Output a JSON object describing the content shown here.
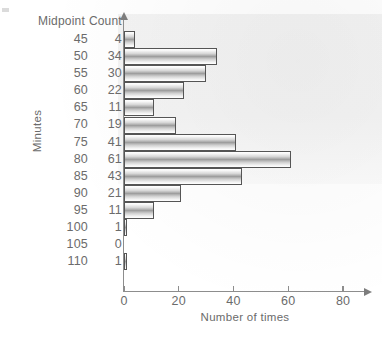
{
  "chart_data": {
    "type": "bar",
    "orientation": "horizontal",
    "title": "",
    "xlabel": "Number of times",
    "ylabel": "Minutes",
    "xlim": [
      0,
      88
    ],
    "xticks": [
      0,
      20,
      40,
      60,
      80
    ],
    "grid": false,
    "legend": null,
    "categories": [
      45,
      50,
      55,
      60,
      65,
      70,
      75,
      80,
      85,
      90,
      95,
      100,
      105,
      110
    ],
    "values": [
      4,
      34,
      30,
      22,
      11,
      19,
      41,
      61,
      43,
      21,
      11,
      1,
      0,
      1
    ]
  },
  "table": {
    "headers": {
      "midpoint": "Midpoint",
      "count": "Count"
    },
    "rows": [
      {
        "midpoint": "45",
        "count": "4"
      },
      {
        "midpoint": "50",
        "count": "34"
      },
      {
        "midpoint": "55",
        "count": "30"
      },
      {
        "midpoint": "60",
        "count": "22"
      },
      {
        "midpoint": "65",
        "count": "11"
      },
      {
        "midpoint": "70",
        "count": "19"
      },
      {
        "midpoint": "75",
        "count": "41"
      },
      {
        "midpoint": "80",
        "count": "61"
      },
      {
        "midpoint": "85",
        "count": "43"
      },
      {
        "midpoint": "90",
        "count": "21"
      },
      {
        "midpoint": "95",
        "count": "11"
      },
      {
        "midpoint": "100",
        "count": "1"
      },
      {
        "midpoint": "105",
        "count": "0"
      },
      {
        "midpoint": "110",
        "count": "1"
      }
    ]
  },
  "axes": {
    "y_title": "Minutes",
    "x_title": "Number of times",
    "x_tick_labels": [
      "0",
      "20",
      "40",
      "60",
      "80"
    ]
  },
  "colors": {
    "ink": "#6b6b6b",
    "axis": "#8d8d8d",
    "bar_outline": "#555555",
    "bar_light": "#ffffff",
    "bar_dark": "#9e9e9e",
    "page": "#ffffff"
  }
}
